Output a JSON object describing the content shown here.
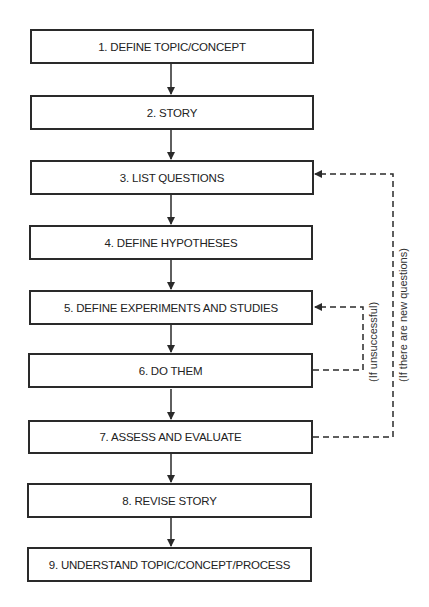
{
  "diagram": {
    "type": "flowchart",
    "steps": [
      {
        "id": 1,
        "label": "1. DEFINE TOPIC/CONCEPT"
      },
      {
        "id": 2,
        "label": "2. STORY"
      },
      {
        "id": 3,
        "label": "3. LIST QUESTIONS"
      },
      {
        "id": 4,
        "label": "4. DEFINE HYPOTHESES"
      },
      {
        "id": 5,
        "label": "5. DEFINE EXPERIMENTS AND STUDIES"
      },
      {
        "id": 6,
        "label": "6. DO THEM"
      },
      {
        "id": 7,
        "label": "7. ASSESS AND EVALUATE"
      },
      {
        "id": 8,
        "label": "8. REVISE STORY"
      },
      {
        "id": 9,
        "label": "9. UNDERSTAND TOPIC/CONCEPT/PROCESS"
      }
    ],
    "feedback_loops": [
      {
        "from": 6,
        "to": 5,
        "label": "(If unsuccessful)",
        "style": "dashed"
      },
      {
        "from": 7,
        "to": 3,
        "label": "(If there are new questions)",
        "style": "dashed"
      }
    ],
    "colors": {
      "line": "#2a2a2a",
      "text": "#222222",
      "background": "#ffffff"
    }
  }
}
